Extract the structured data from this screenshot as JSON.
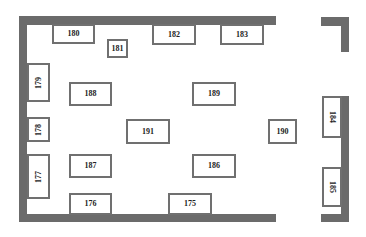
{
  "floor_plan": {
    "colors": {
      "wall": "#6b6b6b",
      "booth_border": "#707070",
      "text": "#222222",
      "background": "#ffffff"
    },
    "walls": [
      {
        "id": "top",
        "x": 19,
        "y": 16,
        "w": 257,
        "h": 9
      },
      {
        "id": "left",
        "x": 19,
        "y": 16,
        "w": 8,
        "h": 206
      },
      {
        "id": "bottom",
        "x": 19,
        "y": 214,
        "w": 257,
        "h": 8
      },
      {
        "id": "right-top-horizontal",
        "x": 321,
        "y": 17,
        "w": 28,
        "h": 9
      },
      {
        "id": "right-top-vertical",
        "x": 341,
        "y": 17,
        "w": 8,
        "h": 35
      },
      {
        "id": "right-lower-vertical",
        "x": 341,
        "y": 96,
        "w": 8,
        "h": 126
      },
      {
        "id": "right-lower-horizontal",
        "x": 321,
        "y": 214,
        "w": 28,
        "h": 8
      }
    ],
    "booths": [
      {
        "label": "175",
        "x": 168,
        "y": 193,
        "w": 44,
        "h": 22,
        "rotate": "none"
      },
      {
        "label": "176",
        "x": 69,
        "y": 193,
        "w": 43,
        "h": 22,
        "rotate": "none"
      },
      {
        "label": "177",
        "x": 27,
        "y": 154,
        "w": 23,
        "h": 45,
        "rotate": "ccw"
      },
      {
        "label": "178",
        "x": 27,
        "y": 117,
        "w": 23,
        "h": 25,
        "rotate": "ccw"
      },
      {
        "label": "179",
        "x": 27,
        "y": 63,
        "w": 23,
        "h": 39,
        "rotate": "ccw"
      },
      {
        "label": "180",
        "x": 52,
        "y": 24,
        "w": 43,
        "h": 20,
        "rotate": "none"
      },
      {
        "label": "181",
        "x": 107,
        "y": 39,
        "w": 21,
        "h": 19,
        "rotate": "none"
      },
      {
        "label": "182",
        "x": 152,
        "y": 24,
        "w": 44,
        "h": 21,
        "rotate": "none"
      },
      {
        "label": "183",
        "x": 220,
        "y": 24,
        "w": 44,
        "h": 21,
        "rotate": "none"
      },
      {
        "label": "184",
        "x": 322,
        "y": 96,
        "w": 20,
        "h": 42,
        "rotate": "cw"
      },
      {
        "label": "185",
        "x": 322,
        "y": 167,
        "w": 20,
        "h": 40,
        "rotate": "cw"
      },
      {
        "label": "186",
        "x": 192,
        "y": 154,
        "w": 44,
        "h": 24,
        "rotate": "none"
      },
      {
        "label": "187",
        "x": 69,
        "y": 154,
        "w": 43,
        "h": 24,
        "rotate": "none"
      },
      {
        "label": "188",
        "x": 69,
        "y": 82,
        "w": 43,
        "h": 24,
        "rotate": "none"
      },
      {
        "label": "189",
        "x": 192,
        "y": 82,
        "w": 44,
        "h": 24,
        "rotate": "none"
      },
      {
        "label": "190",
        "x": 268,
        "y": 119,
        "w": 29,
        "h": 25,
        "rotate": "none"
      },
      {
        "label": "191",
        "x": 126,
        "y": 119,
        "w": 44,
        "h": 25,
        "rotate": "none"
      }
    ]
  }
}
